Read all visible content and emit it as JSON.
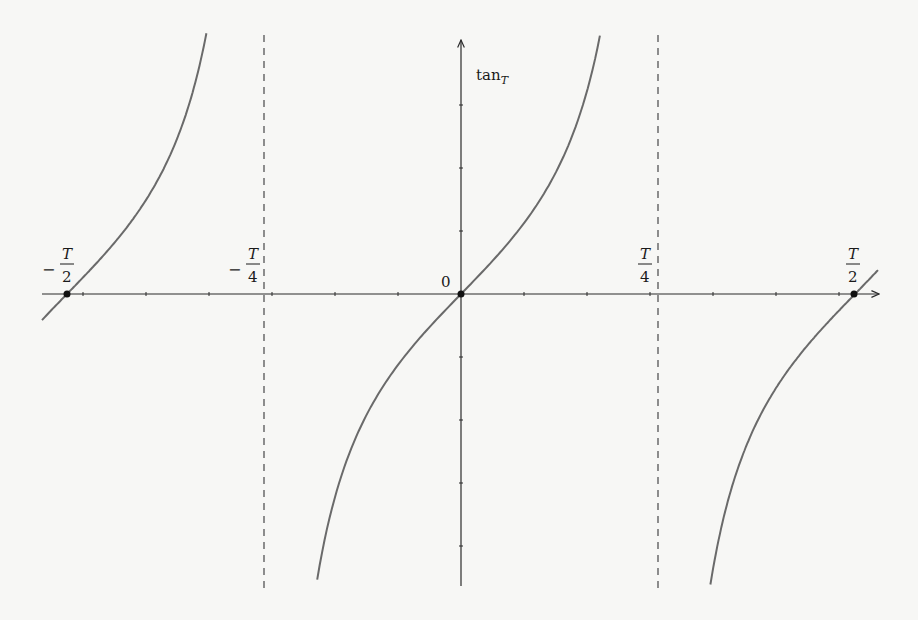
{
  "chart_data": {
    "type": "line",
    "title": "",
    "function": "tan_T(x) = tan(pi*x/T)",
    "ylabel": "tan_T",
    "ylabel_main": "tan",
    "ylabel_sub": "T",
    "xlabel": "",
    "x_tick_labels": [
      {
        "sign": "−",
        "num": "T",
        "den": "2",
        "value": "-T/2"
      },
      {
        "sign": "−",
        "num": "T",
        "den": "4",
        "value": "-T/4"
      },
      {
        "sign": "",
        "num": "0",
        "den": "",
        "value": "0"
      },
      {
        "sign": "",
        "num": "T",
        "den": "4",
        "value": "T/4"
      },
      {
        "sign": "",
        "num": "T",
        "den": "2",
        "value": "T/2"
      }
    ],
    "origin_label": "0",
    "zeros": [
      "-T/2",
      "0",
      "T/2"
    ],
    "vertical_asymptotes": [
      "-T/4",
      "T/4"
    ],
    "asymptote_style": "dashed",
    "grid": false,
    "branches": [
      {
        "name": "left-branch",
        "x_range": [
          "-T/2 - small",
          "-T/4"
        ],
        "behavior": "increasing toward +inf"
      },
      {
        "name": "middle-branch",
        "x_range": [
          "-T/4",
          "T/4"
        ],
        "behavior": "increasing from -inf to +inf through 0"
      },
      {
        "name": "right-branch",
        "x_range": [
          "T/4",
          "T/2 + small"
        ],
        "behavior": "increasing from -inf through 0"
      }
    ],
    "marked_points": [
      {
        "x": "-T/2",
        "y": 0
      },
      {
        "x": "0",
        "y": 0
      },
      {
        "x": "T/2",
        "y": 0
      }
    ]
  },
  "colors": {
    "axis": "#2a2a2a",
    "curve": "#6a6a6a",
    "asymptote": "#555555",
    "point": "#111111",
    "background": "#f7f7f5"
  }
}
